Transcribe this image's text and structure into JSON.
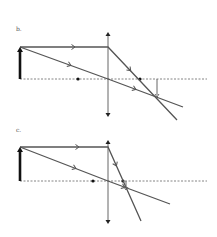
{
  "diagrams": [
    {
      "id": "b",
      "label": "b.",
      "label_pos": [
        16,
        30
      ],
      "axis": {
        "y": 79,
        "x1": 20,
        "x2": 207
      },
      "lens": {
        "x": 108,
        "y1": 32,
        "y2": 117
      },
      "object": {
        "x": 20,
        "y_top": 47,
        "y_base": 79
      },
      "focal_points": [
        {
          "x": 78,
          "y": 79
        },
        {
          "x": 140,
          "y": 79
        }
      ],
      "image": {
        "x": 157,
        "y_top": 79,
        "y_tip": 97
      },
      "rays": [
        {
          "name": "parallel-ray",
          "points": [
            [
              20,
              47
            ],
            [
              108,
              47
            ],
            [
              177,
              120
            ]
          ],
          "arrows": [
            [
              74,
              47
            ],
            [
              130,
              70
            ]
          ]
        },
        {
          "name": "chief-ray",
          "points": [
            [
              20,
              47
            ],
            [
              108,
              79
            ],
            [
              183,
              107
            ]
          ],
          "arrows": [
            [
              70,
              65
            ],
            [
              135,
              89
            ]
          ]
        }
      ]
    },
    {
      "id": "c",
      "label": "c.",
      "label_pos": [
        16,
        131
      ],
      "axis": {
        "y": 181,
        "x1": 20,
        "x2": 207
      },
      "lens": {
        "x": 108,
        "y1": 140,
        "y2": 224
      },
      "object": {
        "x": 20,
        "y_top": 147,
        "y_base": 181
      },
      "focal_points": [
        {
          "x": 93,
          "y": 181
        },
        {
          "x": 123,
          "y": 181
        }
      ],
      "image": {
        "x": 126,
        "y_top": 181,
        "y_tip": 190
      },
      "rays": [
        {
          "name": "parallel-ray",
          "points": [
            [
              20,
              147
            ],
            [
              108,
              147
            ],
            [
              141,
              221
            ]
          ],
          "arrows": [
            [
              78,
              147
            ],
            [
              116,
              165
            ]
          ]
        },
        {
          "name": "chief-ray",
          "points": [
            [
              20,
              147
            ],
            [
              108,
              181
            ],
            [
              170,
              204
            ]
          ],
          "arrows": [
            [
              75,
              168
            ],
            [
              124,
              187
            ]
          ]
        }
      ]
    }
  ],
  "colors": {
    "ray": "#555555",
    "axis": "#666666",
    "lens": "#555555",
    "object": "#111111",
    "image": "#666666",
    "focal": "#111111"
  }
}
